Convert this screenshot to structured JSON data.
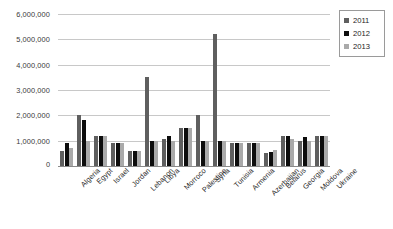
{
  "chart_data": {
    "type": "bar",
    "title": "",
    "xlabel": "",
    "ylabel": "",
    "ylim": [
      0,
      6000000
    ],
    "ytick_values": [
      6000000,
      5000000,
      4000000,
      3000000,
      2000000,
      1000000,
      0
    ],
    "ytick_labels": [
      "6,000,000",
      "5,000,000",
      "4,000,000",
      "3,000,000",
      "2,000,000",
      "1,000,000",
      "0"
    ],
    "grid": true,
    "legend_position": "right",
    "categories": [
      "Algeria",
      "Egypt",
      "Israel",
      "Jordan",
      "Lebanon",
      "Libya",
      "Morroco",
      "Palestine",
      "Syria",
      "Tunisia",
      "Armenia",
      "Azerbaijan",
      "Belarus",
      "Georgia",
      "Moldova",
      "Ukraine"
    ],
    "series": [
      {
        "name": "2011",
        "color": "#5f5f5f",
        "values": [
          580000,
          2000000,
          1180000,
          890000,
          600000,
          3500000,
          1050000,
          1500000,
          2000000,
          5200000,
          900000,
          900000,
          500000,
          1200000,
          1000000,
          1200000
        ]
      },
      {
        "name": "2012",
        "color": "#0d0d0d",
        "values": [
          900000,
          1800000,
          1200000,
          890000,
          600000,
          1000000,
          1200000,
          1500000,
          1000000,
          1000000,
          900000,
          900000,
          560000,
          1200000,
          1150000,
          1200000
        ]
      },
      {
        "name": "2013",
        "color": "#aaaaaa",
        "values": [
          720000,
          1000000,
          1200000,
          890000,
          600000,
          1000000,
          1000000,
          1500000,
          1000000,
          1000000,
          900000,
          900000,
          620000,
          1050000,
          1000000,
          1200000
        ]
      }
    ]
  },
  "legend": {
    "items": [
      {
        "label": "2011",
        "swatch": "legend-swatch-2011"
      },
      {
        "label": "2012",
        "swatch": "legend-swatch-2012"
      },
      {
        "label": "2013",
        "swatch": "legend-swatch-2013"
      }
    ]
  }
}
